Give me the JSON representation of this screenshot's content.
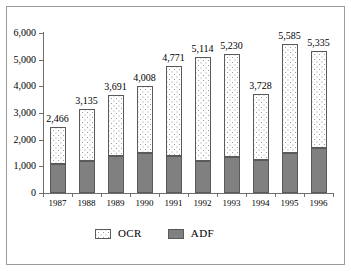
{
  "chart_data": {
    "type": "bar",
    "subtype": "stacked-vertical",
    "title": "",
    "xlabel": "",
    "ylabel": "",
    "ylim": [
      0,
      6000
    ],
    "yticks": [
      "0",
      "1,000",
      "2,000",
      "3,000",
      "4,000",
      "5,000",
      "6,000"
    ],
    "ytick_values": [
      0,
      1000,
      2000,
      3000,
      4000,
      5000,
      6000
    ],
    "grid": false,
    "legend_position": "bottom",
    "categories": [
      "1987",
      "1988",
      "1989",
      "1990",
      "1991",
      "1992",
      "1993",
      "1994",
      "1995",
      "1996"
    ],
    "series": [
      {
        "name": "ADF",
        "color": "#808080",
        "values": [
          1088,
          1200,
          1390,
          1500,
          1370,
          1200,
          1340,
          1230,
          1500,
          1670
        ]
      },
      {
        "name": "OCR",
        "color": "#ffffff",
        "values": [
          1378,
          1935,
          2301,
          2508,
          3401,
          3914,
          3890,
          2498,
          4085,
          3665
        ]
      }
    ],
    "totals": [
      2466,
      3135,
      3691,
      4008,
      4771,
      5114,
      5230,
      3728,
      5585,
      5335
    ],
    "total_labels": [
      "2,466",
      "3,135",
      "3,691",
      "4,008",
      "4,771",
      "5,114",
      "5,230",
      "3,728",
      "5,585",
      "5,335"
    ]
  },
  "legend": {
    "items": [
      {
        "label": "OCR",
        "swatch": "dotted-white-swatch"
      },
      {
        "label": "ADF",
        "swatch": "solid-gray-swatch"
      }
    ]
  }
}
